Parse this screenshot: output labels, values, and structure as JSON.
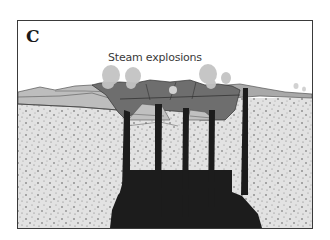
{
  "figure": {
    "panel_label": "C",
    "caption": "Steam explosions"
  },
  "colors": {
    "frame": "#3a3a3a",
    "background": "#ffffff",
    "country_rock": "#e2e2e2",
    "speckle": "#5a5a5a",
    "surface_layers_light": "#bdbdbd",
    "surface_layers_mid": "#9a9a9a",
    "crater_fill": "#6e6e6e",
    "magma_dykes": "#1c1c1c",
    "steam_plumes": "#c4c4c4"
  },
  "elements": {
    "plumes": 6,
    "dykes": 5,
    "magma_body": "dark intrusion at base"
  }
}
